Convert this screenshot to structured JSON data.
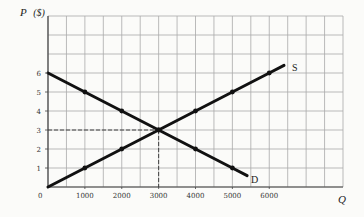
{
  "chart_data": {
    "type": "line",
    "title": "",
    "xlabel": "Q",
    "ylabel": "P ($)",
    "ylabel_symbol": "P",
    "ylabel_unit": "($)",
    "xlim": [
      0,
      8000
    ],
    "ylim": [
      0,
      9
    ],
    "grid": true,
    "grid_step_x": 500,
    "grid_step_y": 1,
    "x_ticks": [
      0,
      1000,
      2000,
      3000,
      4000,
      5000,
      6000
    ],
    "x_tick_labels": [
      "0",
      "1000",
      "2000",
      "3000",
      "4000",
      "5000",
      "6000"
    ],
    "y_ticks": [
      1,
      2,
      3,
      4,
      5,
      6
    ],
    "y_tick_labels": [
      "1",
      "2",
      "3",
      "4",
      "5",
      "6"
    ],
    "series": [
      {
        "name": "S",
        "label": "S",
        "x": [
          0,
          1000,
          2000,
          3000,
          4000,
          5000,
          6000,
          6400
        ],
        "y": [
          0,
          1,
          2,
          3,
          4,
          5,
          6,
          6.4
        ],
        "markers_at": [
          1000,
          2000,
          3000,
          4000,
          5000,
          6000
        ]
      },
      {
        "name": "D",
        "label": "D",
        "x": [
          0,
          1000,
          2000,
          3000,
          4000,
          5000,
          5400
        ],
        "y": [
          6,
          5,
          4,
          3,
          2,
          1,
          0.6
        ],
        "markers_at": [
          1000,
          2000,
          3000,
          4000,
          5000
        ]
      }
    ],
    "annotations": [
      {
        "type": "equilibrium",
        "x": 3000,
        "y": 3,
        "style": "dashed guide lines to both axes"
      }
    ],
    "legend": "none (curves labeled inline: S and D)"
  },
  "labels": {
    "y_symbol": "P",
    "y_unit": "($)",
    "x_symbol": "Q",
    "origin": "0",
    "supply": "S",
    "demand": "D"
  }
}
